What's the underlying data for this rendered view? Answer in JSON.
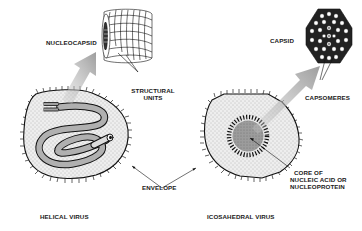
{
  "diagram": {
    "helical_virus": {
      "title": "HELICAL VIRUS",
      "detail_label": "NUCLEOCAPSID",
      "detail_sublabel_line1": "STRUCTURAL",
      "detail_sublabel_line2": "UNITS"
    },
    "icosahedral_virus": {
      "title": "ICOSAHEDRAL VIRUS",
      "detail_label": "CAPSID",
      "detail_sublabel": "CAPSOMERES",
      "core_label_line1": "CORE OF",
      "core_label_line2": "NUCLEIC ACID OR",
      "core_label_line3": "NUCLEOPROTEIN"
    },
    "shared": {
      "envelope_label": "ENVELOPE"
    },
    "colors": {
      "background": "#ffffff",
      "ink": "#1a1a1a",
      "envelope_fill": "#e6e6e6",
      "core_fill": "#9a9a9a",
      "arrow_fill": "#b8b8b8",
      "tube_fill": "#a8a8a8"
    }
  }
}
